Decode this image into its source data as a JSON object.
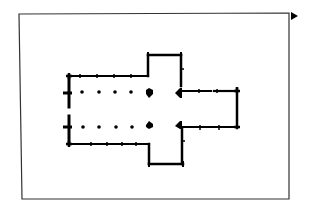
{
  "diagram": {
    "type": "architectural floor plan",
    "colors": {
      "ink": "#000000",
      "frame": "#333333",
      "background": "#ffffff"
    },
    "frame": {
      "x1": 19,
      "y1": 14,
      "x2": 289,
      "y2": 14,
      "x3": 289,
      "y3": 199,
      "x4": 22,
      "y4": 199
    },
    "marker": {
      "shape": "triangle-right",
      "x": 291,
      "y": 16
    },
    "parts": [
      {
        "name": "nave",
        "columns_per_row": 4,
        "rows": 2
      },
      {
        "name": "north-transept"
      },
      {
        "name": "south-transept"
      },
      {
        "name": "crossing",
        "piers": 4
      },
      {
        "name": "chancel"
      },
      {
        "name": "west-entrance"
      }
    ],
    "columns": {
      "row_y": [
        92,
        127
      ],
      "x": [
        82,
        99,
        115,
        131
      ]
    },
    "crossing_piers": [
      {
        "x": 150,
        "y": 92
      },
      {
        "x": 150,
        "y": 126
      },
      {
        "x": 178,
        "y": 92
      },
      {
        "x": 178,
        "y": 126
      }
    ]
  }
}
